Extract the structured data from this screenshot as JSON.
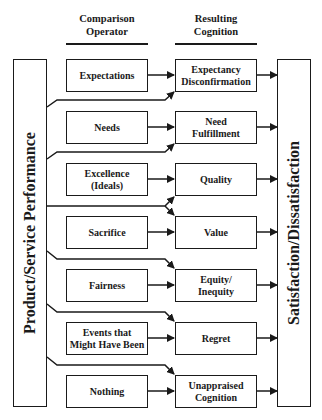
{
  "headers": {
    "operator": "Comparison\nOperator",
    "operator_line1": "Comparison",
    "operator_line2": "Operator",
    "cognition_line1": "Resulting",
    "cognition_line2": "Cognition"
  },
  "left_box": "Product/Service Performance",
  "right_box": "Satisfaction/Dissatisfaction",
  "rows": [
    {
      "operator": [
        "Expectations"
      ],
      "cognition": [
        "Expectancy",
        "Disconfirmation"
      ]
    },
    {
      "operator": [
        "Needs"
      ],
      "cognition": [
        "Need",
        "Fulfillment"
      ]
    },
    {
      "operator": [
        "Excellence",
        "(Ideals)"
      ],
      "cognition": [
        "Quality"
      ]
    },
    {
      "operator": [
        "Sacrifice"
      ],
      "cognition": [
        "Value"
      ]
    },
    {
      "operator": [
        "Fairness"
      ],
      "cognition": [
        "Equity/",
        "Inequity"
      ]
    },
    {
      "operator": [
        "Events that",
        "Might Have Been"
      ],
      "cognition": [
        "Regret"
      ]
    },
    {
      "operator": [
        "Nothing"
      ],
      "cognition": [
        "Unappraised",
        "Cognition"
      ]
    }
  ],
  "colors": {
    "stroke": "#1a1a1a",
    "background": "#ffffff"
  }
}
